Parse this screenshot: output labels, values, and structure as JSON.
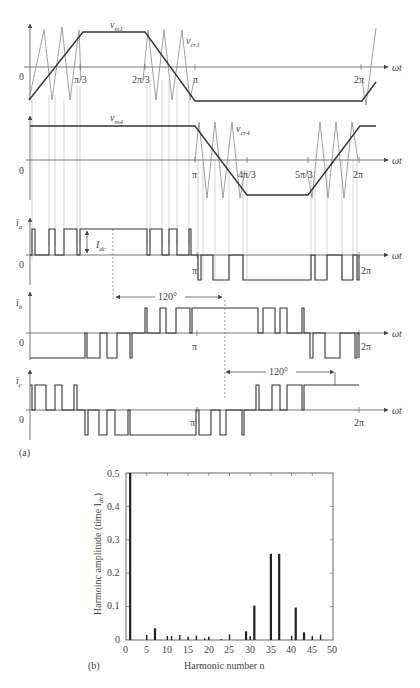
{
  "panel_a": {
    "label": "(a)",
    "plot1": {
      "mod_label": "v",
      "mod_sub": "m1",
      "car_label": "v",
      "car_sub": "cr1",
      "x_label": "ωt",
      "ticks": [
        "0",
        "π/3",
        "2π/3",
        "π",
        "2π"
      ]
    },
    "plot2": {
      "mod_label": "v",
      "mod_sub": "m4",
      "car_label": "v",
      "car_sub": "cr4",
      "x_label": "ωt",
      "ticks": [
        "0",
        "π",
        "4π/3",
        "5π/3",
        "2π"
      ]
    },
    "plot3": {
      "y_label": "i",
      "y_sub": "a",
      "amp_label": "I",
      "amp_sub": "dc",
      "x_label": "ωt",
      "ticks": [
        "0",
        "π",
        "2π"
      ]
    },
    "plot4": {
      "y_label": "i",
      "y_sub": "b",
      "x_label": "ωt",
      "ticks": [
        "0",
        "π",
        "2π"
      ],
      "shift_label": "120°"
    },
    "plot5": {
      "y_label": "i",
      "y_sub": "c",
      "x_label": "ωt",
      "ticks": [
        "0",
        "π",
        "2π"
      ],
      "shift_label": "120°"
    }
  },
  "panel_b": {
    "label": "(b)",
    "ylabel": "Harmoinc amplitude (time I",
    "ylabel_sub": "dc",
    "ylabel_end": ")",
    "xlabel": "Harmonic number n",
    "yticks": [
      "0",
      "0.1",
      "0.2",
      "0.3",
      "0.4",
      "0.5"
    ],
    "xticks": [
      "0",
      "5",
      "10",
      "15",
      "20",
      "25",
      "30",
      "35",
      "40",
      "45",
      "50"
    ]
  },
  "chart_data": [
    {
      "type": "line",
      "title": "PWM waveforms: modulating/carrier signals and line currents i_a, i_b, i_c",
      "xlabel": "ωt",
      "x_ticks": [
        "0",
        "π/3",
        "2π/3",
        "π",
        "4π/3",
        "5π/3",
        "2π"
      ],
      "series": [
        {
          "name": "v_m1",
          "description": "trapezoidal modulating wave, rising 0→π/3, flat to 2π/3, falling to π, flat negative to ~2π"
        },
        {
          "name": "v_cr1",
          "description": "triangular carrier active during transitions"
        },
        {
          "name": "v_m4",
          "description": "flat high 0→π, falling π→4π/3, flat low to 5π/3, rising to 2π"
        },
        {
          "name": "v_cr4",
          "description": "triangular carrier active during transitions"
        },
        {
          "name": "i_a",
          "description": "PWM current pulses of amplitude I_dc, positive half 0→π, negative half π→2π"
        },
        {
          "name": "i_b",
          "description": "i_a shifted by 120°"
        },
        {
          "name": "i_c",
          "description": "i_b shifted by 120°"
        }
      ],
      "annotations": [
        "I_dc",
        "120°",
        "120°"
      ]
    },
    {
      "type": "bar",
      "title": "",
      "xlabel": "Harmonic number n",
      "ylabel": "Harmoinc amplitude (time I_dc)",
      "xlim": [
        0,
        50
      ],
      "ylim": [
        0,
        0.5
      ],
      "x": [
        1,
        5,
        7,
        10,
        11,
        13,
        15,
        17,
        19,
        20,
        23,
        25,
        29,
        30,
        31,
        35,
        37,
        40,
        41,
        43,
        45,
        47
      ],
      "values": [
        0.5,
        0.015,
        0.035,
        0.012,
        0.012,
        0.015,
        0.01,
        0.013,
        0.005,
        0.01,
        0.003,
        0.017,
        0.026,
        0.012,
        0.103,
        0.258,
        0.258,
        0.012,
        0.097,
        0.023,
        0.012,
        0.016
      ],
      "grid": false
    }
  ]
}
